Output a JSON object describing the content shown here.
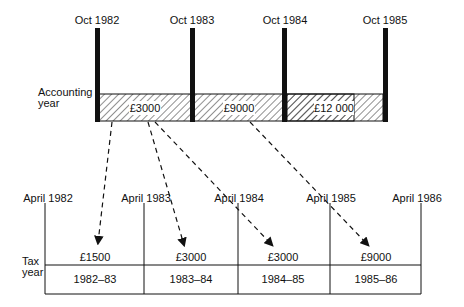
{
  "accounting": {
    "row_label_line1": "Accounting",
    "row_label_line2": "year",
    "dates": [
      "Oct 1982",
      "Oct 1983",
      "Oct 1984",
      "Oct 1985"
    ],
    "amounts": [
      "£3000",
      "£9000",
      "£12 000"
    ]
  },
  "tax": {
    "row_label_line1": "Tax",
    "row_label_line2": "year",
    "dates": [
      "April 1982",
      "April 1983",
      "April 1984",
      "April 1985",
      "April 1986"
    ],
    "amounts": [
      "£1500",
      "£3000",
      "£3000",
      "£9000"
    ],
    "years": [
      "1982–83",
      "1983–84",
      "1984–85",
      "1985–86"
    ]
  }
}
